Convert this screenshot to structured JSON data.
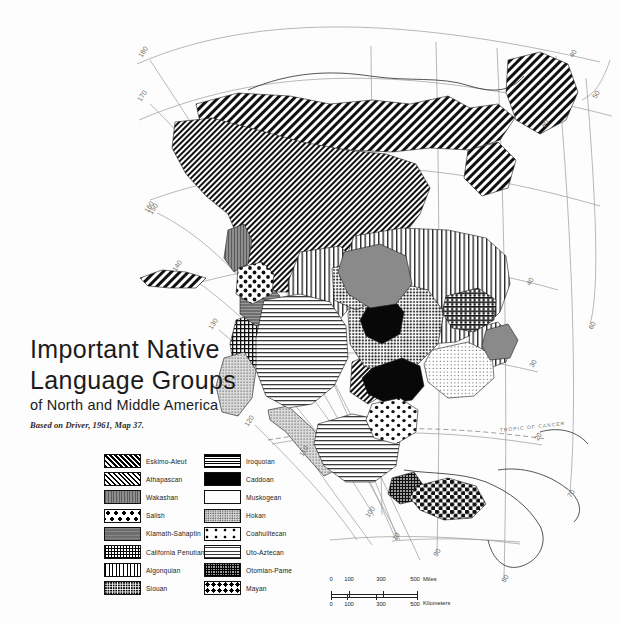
{
  "map": {
    "title_line1": "Important Native",
    "title_line2": "Language Groups",
    "subtitle": "of North and Middle America",
    "source": "Based on Driver, 1961, Map 37.",
    "tropic_label": "TROPIC OF CANCER",
    "graticule_labels": [
      {
        "text": "180",
        "x": 142,
        "y": 58
      },
      {
        "text": "170",
        "x": 141,
        "y": 102
      },
      {
        "text": "160",
        "x": 148,
        "y": 213
      },
      {
        "text": "150",
        "x": 152,
        "y": 215
      },
      {
        "text": "140",
        "x": 176,
        "y": 272
      },
      {
        "text": "130",
        "x": 212,
        "y": 330
      },
      {
        "text": "120",
        "x": 248,
        "y": 427
      },
      {
        "text": "110",
        "x": 303,
        "y": 457
      },
      {
        "text": "100",
        "x": 369,
        "y": 518
      },
      {
        "text": "90",
        "x": 437,
        "y": 557
      },
      {
        "text": "80",
        "x": 505,
        "y": 583
      },
      {
        "text": "70",
        "x": 571,
        "y": 498
      },
      {
        "text": "60",
        "x": 592,
        "y": 330
      },
      {
        "text": "50",
        "x": 596,
        "y": 99
      },
      {
        "text": "40",
        "x": 573,
        "y": 58
      },
      {
        "text": "20",
        "x": 538,
        "y": 441
      },
      {
        "text": "30",
        "x": 533,
        "y": 368
      },
      {
        "text": "40",
        "x": 530,
        "y": 286
      },
      {
        "text": "60",
        "x": 545,
        "y": 128
      },
      {
        "text": "10",
        "x": 396,
        "y": 541
      }
    ]
  },
  "legend": {
    "left_column": [
      {
        "label": "Eskimo-Aleut",
        "pattern": "eskimo",
        "icon": "swatch-eskimo-aleut"
      },
      {
        "label": "Athapascan",
        "pattern": "athapascan",
        "icon": "swatch-athapascan"
      },
      {
        "label": "Wakashan",
        "pattern": "wakashan",
        "icon": "swatch-wakashan"
      },
      {
        "label": "Salish",
        "pattern": "salish",
        "icon": "swatch-salish"
      },
      {
        "label": "Klamath-Sahaptin",
        "pattern": "klamath",
        "icon": "swatch-klamath-sahaptin"
      },
      {
        "label": "California Penutian",
        "pattern": "calif",
        "icon": "swatch-california-penutian"
      },
      {
        "label": "Algonquian",
        "pattern": "algonquian",
        "icon": "swatch-algonquian"
      },
      {
        "label": "Siouan",
        "pattern": "siouan",
        "icon": "swatch-siouan"
      }
    ],
    "right_column": [
      {
        "label": "Iroquoian",
        "pattern": "iroquoian",
        "icon": "swatch-iroquoian"
      },
      {
        "label": "Caddoan",
        "pattern": "caddoan",
        "icon": "swatch-caddoan"
      },
      {
        "label": "Muskogean",
        "pattern": "muskogean",
        "icon": "swatch-muskogean"
      },
      {
        "label": "Hokan",
        "pattern": "hokan",
        "icon": "swatch-hokan"
      },
      {
        "label": "Coahuiltecan",
        "pattern": "coahuiltecan",
        "icon": "swatch-coahuiltecan"
      },
      {
        "label": "Uto-Aztecan",
        "pattern": "utoaztecan",
        "icon": "swatch-uto-aztecan"
      },
      {
        "label": "Otomian-Pame",
        "pattern": "otomian",
        "icon": "swatch-otomian-pame"
      },
      {
        "label": "Mayan",
        "pattern": "mayan",
        "icon": "swatch-mayan"
      }
    ]
  },
  "scale": {
    "miles": {
      "ticks": [
        "0",
        "100",
        "300",
        "500"
      ],
      "unit": "Miles"
    },
    "kilometers": {
      "ticks": [
        "0",
        "100",
        "300",
        "500"
      ],
      "unit": "Kilometers"
    }
  },
  "colors": {
    "background": "#fdfdfd",
    "graticule": "#9a9a9a",
    "coastline": "#2a2a2a",
    "ink": "#1a1a1a"
  }
}
